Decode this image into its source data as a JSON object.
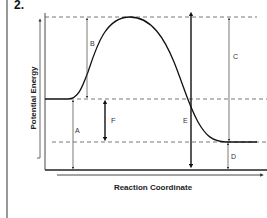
{
  "question_number": "2.",
  "diagram": {
    "type": "potential-energy-diagram",
    "y_axis_label": "Potential Energy",
    "x_axis_label": "Reaction Coordinate",
    "labels": {
      "A": "A",
      "B": "B",
      "C": "C",
      "D": "D",
      "E": "E",
      "F": "F"
    },
    "levels": {
      "reactants": "middle dashed line",
      "activated_complex": "top dashed line",
      "products": "lower dashed line"
    },
    "colors": {
      "line": "#222222",
      "dashed": "#555555",
      "background": "#ffffff"
    }
  }
}
